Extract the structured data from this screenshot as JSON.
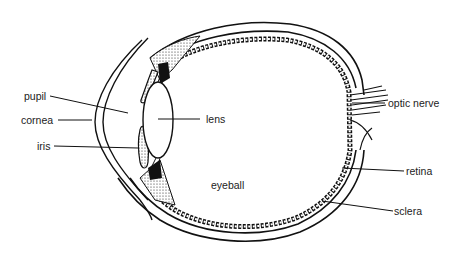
{
  "diagram": {
    "labels": {
      "pupil": "pupil",
      "cornea": "cornea",
      "iris": "iris",
      "lens": "lens",
      "eyeball": "eyeball",
      "optic_nerve": "optic nerve",
      "retina": "retina",
      "sclera": "sclera"
    },
    "colors": {
      "ink": "#111111",
      "background": "#ffffff",
      "label_text": "#222222"
    }
  }
}
